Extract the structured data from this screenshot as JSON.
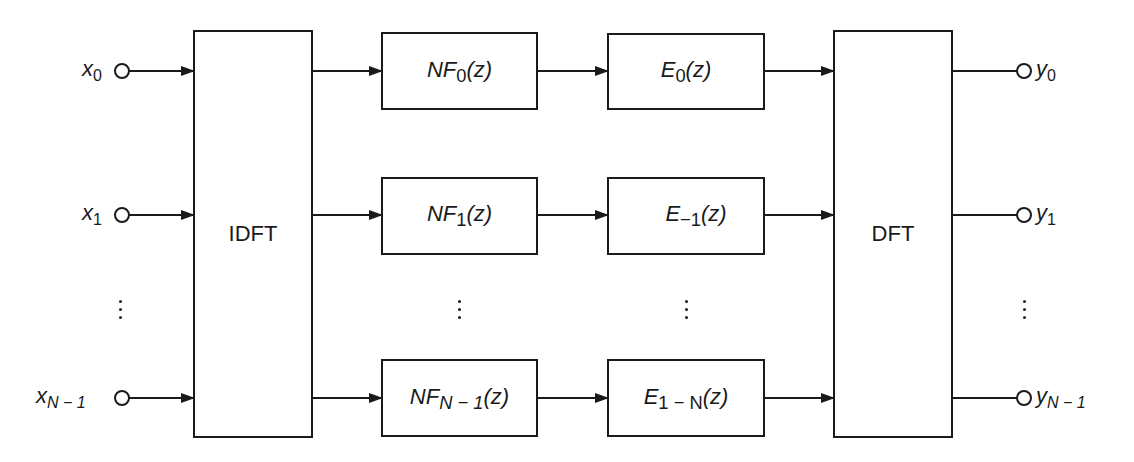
{
  "diagram": {
    "type": "block-diagram",
    "stroke_color": "#1a1a1a",
    "background": "#ffffff",
    "inputs": [
      {
        "base": "x",
        "sub": "0",
        "sub_italic": false
      },
      {
        "base": "x",
        "sub": "1",
        "sub_italic": false
      },
      {
        "base": "x",
        "sub": "N − 1",
        "sub_italic": true
      }
    ],
    "outputs": [
      {
        "base": "y",
        "sub": "0",
        "sub_italic": false
      },
      {
        "base": "y",
        "sub": "1",
        "sub_italic": false
      },
      {
        "base": "y",
        "sub": "N − 1",
        "sub_italic": true
      }
    ],
    "transform_blocks": {
      "left": "IDFT",
      "right": "DFT"
    },
    "filter_blocks": [
      {
        "name": "NF",
        "sub": "0",
        "arg": "(z)"
      },
      {
        "name": "NF",
        "sub": "1",
        "arg": "(z)"
      },
      {
        "name": "NF",
        "sub": "N − 1",
        "arg": "(z)"
      }
    ],
    "polyphase_blocks": [
      {
        "name": "E",
        "sub": "0",
        "arg": "(z)"
      },
      {
        "name": "E",
        "sub": "−1",
        "arg": "(z)"
      },
      {
        "name": "E",
        "sub": "1 − N",
        "arg": "(z)"
      }
    ],
    "ellipsis": "⋮"
  }
}
